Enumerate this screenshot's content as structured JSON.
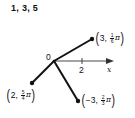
{
  "title": "1, 3, 5",
  "diagram": {
    "type": "polar-points",
    "origin_label": "0",
    "axis": {
      "tick_label": "2",
      "axis_label": "x"
    },
    "points": [
      {
        "r": "3",
        "theta_num": "1",
        "theta_den": "6",
        "pi": "π",
        "comma": ",",
        "display": "(3, π/6)"
      },
      {
        "r": "2",
        "theta_num": "5",
        "theta_den": "4",
        "pi": "π",
        "comma": ",",
        "display": "(2, 5π/4)"
      },
      {
        "r": "−3",
        "theta_num": "2",
        "theta_den": "3",
        "pi": "π",
        "comma": ",",
        "display": "(−3, 2π/3)"
      }
    ],
    "paren_open": "(",
    "paren_close": ")",
    "colors": {
      "line": "#111111",
      "axis": "#333333",
      "background": "#ffffff"
    }
  }
}
